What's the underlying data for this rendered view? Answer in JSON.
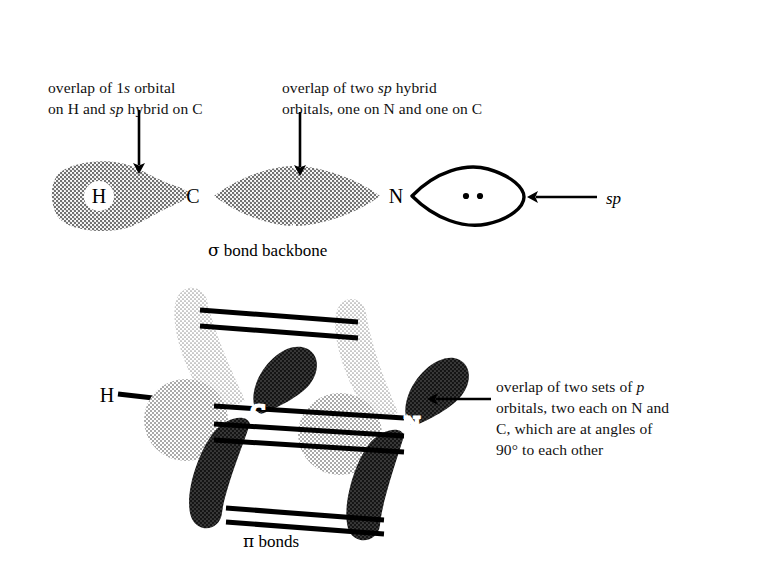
{
  "figure": {
    "background": "#ffffff",
    "ink": "#000000"
  },
  "captions": {
    "overlap_1s": "overlap of 1s orbital\non H and sp hybrid on C",
    "overlap_1s_italic_parts": [
      "1s",
      "sp"
    ],
    "overlap_sp": "overlap of two sp hybrid\norbitals, one on N and one on C",
    "overlap_sp_italic_parts": [
      "sp"
    ],
    "overlap_p": "overlap of two sets of p\norbitals, two each on N and\nC, which are at angles of\n90° to each other",
    "overlap_p_italic_parts": [
      "p"
    ]
  },
  "sigma_diagram": {
    "figure_label": "σ bond backbone",
    "figure_label_symbol": "σ",
    "figure_label_text": "bond backbone",
    "atoms": [
      {
        "symbol": "H",
        "x": 99,
        "y": 196
      },
      {
        "symbol": "C",
        "x": 193,
        "y": 196
      },
      {
        "symbol": "N",
        "x": 396,
        "y": 196
      }
    ],
    "lone_pair": {
      "label": "sp",
      "label_x": 613,
      "label_y": 198,
      "electron_dots": 2,
      "outline_color": "#000000",
      "fill_color": "#ffffff"
    },
    "annotation_arrows": [
      {
        "name": "arrow-to-H-C-overlap",
        "x1": 139,
        "y1": 110,
        "x2": 139,
        "y2": 173,
        "direction": "down"
      },
      {
        "name": "arrow-to-C-N-overlap",
        "x1": 300,
        "y1": 112,
        "x2": 300,
        "y2": 175,
        "direction": "down"
      },
      {
        "name": "arrow-to-lone-pair",
        "x1": 595,
        "y1": 197,
        "x2": 524,
        "y2": 197,
        "direction": "left"
      }
    ],
    "lobe_fill": "#9a9a9a",
    "lobe_texture": "halftone-stipple"
  },
  "pi_diagram": {
    "figure_label": "π bonds",
    "figure_label_symbol": "π",
    "figure_label_text": "bonds",
    "atoms": [
      {
        "symbol": "H",
        "x": 107,
        "y": 396
      },
      {
        "symbol": "C",
        "x": 258,
        "y": 411
      },
      {
        "symbol": "N",
        "x": 412,
        "y": 423
      }
    ],
    "p_orbital_sets": 2,
    "lobes_per_atom": 4,
    "angle_between_sets": "90°",
    "lobe_colors": {
      "light": "#b9b9b9",
      "dark": "#111111",
      "back": "#cfcfcf"
    },
    "bond_lines": "double parallel rails",
    "annotation_arrow": {
      "name": "arrow-to-p-overlap",
      "x1": 489,
      "y1": 399,
      "x2": 424,
      "y2": 399,
      "direction": "left"
    }
  }
}
